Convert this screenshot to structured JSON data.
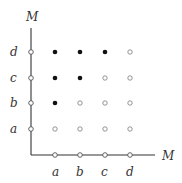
{
  "diagram": {
    "type": "grid-poset",
    "axes": {
      "x_label": "M",
      "y_label": "M"
    },
    "x_ticks": [
      "a",
      "b",
      "c",
      "d"
    ],
    "y_ticks": [
      "a",
      "b",
      "c",
      "d"
    ],
    "points": [
      {
        "x": "a",
        "y": "a",
        "filled": false
      },
      {
        "x": "b",
        "y": "a",
        "filled": false
      },
      {
        "x": "c",
        "y": "a",
        "filled": false
      },
      {
        "x": "d",
        "y": "a",
        "filled": false
      },
      {
        "x": "a",
        "y": "b",
        "filled": true
      },
      {
        "x": "b",
        "y": "b",
        "filled": false
      },
      {
        "x": "c",
        "y": "b",
        "filled": false
      },
      {
        "x": "d",
        "y": "b",
        "filled": false
      },
      {
        "x": "a",
        "y": "c",
        "filled": true
      },
      {
        "x": "b",
        "y": "c",
        "filled": true
      },
      {
        "x": "c",
        "y": "c",
        "filled": false
      },
      {
        "x": "d",
        "y": "c",
        "filled": false
      },
      {
        "x": "a",
        "y": "d",
        "filled": true
      },
      {
        "x": "b",
        "y": "d",
        "filled": true
      },
      {
        "x": "c",
        "y": "d",
        "filled": true
      },
      {
        "x": "d",
        "y": "d",
        "filled": false
      }
    ],
    "colors": {
      "axis": "#333333",
      "filled_point": "#111111",
      "open_point": "#888888",
      "label": "#333333"
    }
  }
}
